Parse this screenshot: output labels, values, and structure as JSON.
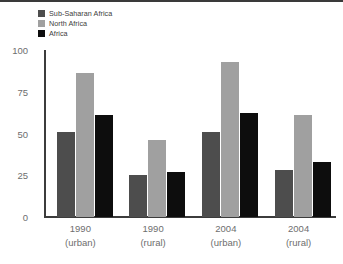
{
  "chart_data": {
    "type": "bar",
    "title": "",
    "subtitle": "",
    "xlabel": "",
    "ylabel": "",
    "ylim": [
      0,
      100
    ],
    "yticks": [
      0,
      25,
      50,
      75,
      100
    ],
    "ytick_labels": [
      "0",
      "25",
      "50",
      "75",
      "100"
    ],
    "grid": false,
    "legend_position": "top-left",
    "categories": [
      "1990 (urban)",
      "1990 (rural)",
      "2004 (urban)",
      "2004 (rural)"
    ],
    "category_lines": [
      {
        "line1": "1990",
        "line2": "(urban)"
      },
      {
        "line1": "1990",
        "line2": "(rural)"
      },
      {
        "line1": "2004",
        "line2": "(urban)"
      },
      {
        "line1": "2004",
        "line2": "(rural)"
      }
    ],
    "series": [
      {
        "name": "Sub-Saharan Africa",
        "color": "#4d4d4d",
        "values": [
          51,
          25,
          51,
          28
        ]
      },
      {
        "name": "North Africa",
        "color": "#a0a0a0",
        "values": [
          86,
          46,
          93,
          61
        ]
      },
      {
        "name": "Africa",
        "color": "#0d0d0d",
        "values": [
          61,
          27,
          62,
          33
        ]
      }
    ]
  },
  "legend": {
    "items": [
      {
        "label": "Sub-Saharan Africa",
        "color": "#4d4d4d"
      },
      {
        "label": "North Africa",
        "color": "#a0a0a0"
      },
      {
        "label": "Africa",
        "color": "#0d0d0d"
      }
    ]
  },
  "axis": {
    "tick_color": "#6e6e6e",
    "line_color": "#3c3c3c"
  }
}
